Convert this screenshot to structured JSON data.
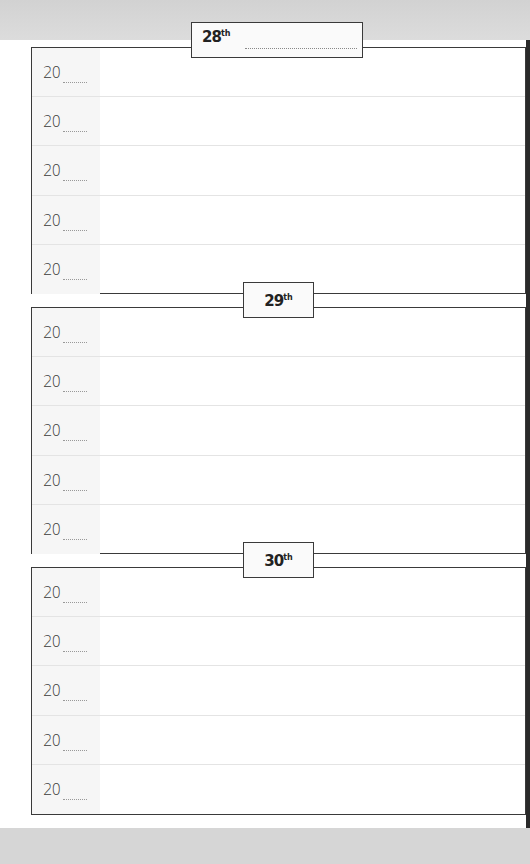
{
  "planner": {
    "sections": [
      {
        "day": "28",
        "suffix": "th",
        "rows": [
          {
            "year_prefix": "20"
          },
          {
            "year_prefix": "20"
          },
          {
            "year_prefix": "20"
          },
          {
            "year_prefix": "20"
          },
          {
            "year_prefix": "20"
          }
        ]
      },
      {
        "day": "29",
        "suffix": "th",
        "rows": [
          {
            "year_prefix": "20"
          },
          {
            "year_prefix": "20"
          },
          {
            "year_prefix": "20"
          },
          {
            "year_prefix": "20"
          },
          {
            "year_prefix": "20"
          }
        ]
      },
      {
        "day": "30",
        "suffix": "th",
        "rows": [
          {
            "year_prefix": "20"
          },
          {
            "year_prefix": "20"
          },
          {
            "year_prefix": "20"
          },
          {
            "year_prefix": "20"
          },
          {
            "year_prefix": "20"
          }
        ]
      }
    ]
  },
  "colors": {
    "border": "#3a3a3a",
    "background": "#ffffff",
    "page_margin": "#d6d6d6",
    "row_divider": "#e4e4e4"
  }
}
